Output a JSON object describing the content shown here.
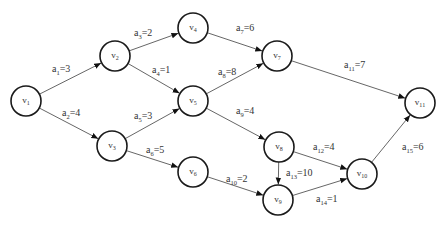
{
  "diagram": {
    "type": "directed-weighted-graph",
    "node_radius": 15,
    "colors": {
      "node_stroke": "#1a1a1a",
      "edge": "#555555",
      "text": "#333333",
      "background": "#ffffff"
    },
    "nodes": [
      {
        "id": "v1",
        "base": "v",
        "sub": "1",
        "x": 26,
        "y": 101
      },
      {
        "id": "v2",
        "base": "v",
        "sub": "2",
        "x": 115,
        "y": 56
      },
      {
        "id": "v3",
        "base": "v",
        "sub": "3",
        "x": 112,
        "y": 146
      },
      {
        "id": "v4",
        "base": "v",
        "sub": "4",
        "x": 193,
        "y": 28
      },
      {
        "id": "v5",
        "base": "v",
        "sub": "5",
        "x": 193,
        "y": 101
      },
      {
        "id": "v6",
        "base": "v",
        "sub": "6",
        "x": 193,
        "y": 172
      },
      {
        "id": "v7",
        "base": "v",
        "sub": "7",
        "x": 277,
        "y": 56
      },
      {
        "id": "v8",
        "base": "v",
        "sub": "8",
        "x": 279,
        "y": 147
      },
      {
        "id": "v9",
        "base": "v",
        "sub": "9",
        "x": 278,
        "y": 200
      },
      {
        "id": "v10",
        "base": "v",
        "sub": "10",
        "x": 362,
        "y": 174
      },
      {
        "id": "v11",
        "base": "v",
        "sub": "11",
        "x": 420,
        "y": 103
      }
    ],
    "edges": [
      {
        "id": "a1",
        "from": "v1",
        "to": "v2",
        "base": "a",
        "sub": "1",
        "weight": "3",
        "lx": 52,
        "ly": 72
      },
      {
        "id": "a2",
        "from": "v1",
        "to": "v3",
        "base": "a",
        "sub": "2",
        "weight": "4",
        "lx": 62,
        "ly": 116
      },
      {
        "id": "a3",
        "from": "v2",
        "to": "v4",
        "base": "a",
        "sub": "3",
        "weight": "2",
        "lx": 134,
        "ly": 36
      },
      {
        "id": "a4",
        "from": "v2",
        "to": "v5",
        "base": "a",
        "sub": "4",
        "weight": "1",
        "lx": 152,
        "ly": 73
      },
      {
        "id": "a5",
        "from": "v3",
        "to": "v5",
        "base": "a",
        "sub": "5",
        "weight": "3",
        "lx": 134,
        "ly": 119
      },
      {
        "id": "a6",
        "from": "v3",
        "to": "v6",
        "base": "a",
        "sub": "6",
        "weight": "5",
        "lx": 146,
        "ly": 153
      },
      {
        "id": "a7",
        "from": "v4",
        "to": "v7",
        "base": "a",
        "sub": "7",
        "weight": "6",
        "lx": 236,
        "ly": 31
      },
      {
        "id": "a8",
        "from": "v5",
        "to": "v7",
        "base": "a",
        "sub": "8",
        "weight": "8",
        "lx": 218,
        "ly": 75
      },
      {
        "id": "a9",
        "from": "v5",
        "to": "v8",
        "base": "a",
        "sub": "9",
        "weight": "4",
        "lx": 236,
        "ly": 114
      },
      {
        "id": "a10",
        "from": "v6",
        "to": "v9",
        "base": "a",
        "sub": "10",
        "weight": "2",
        "lx": 226,
        "ly": 182
      },
      {
        "id": "a11",
        "from": "v7",
        "to": "v11",
        "base": "a",
        "sub": "11",
        "weight": "7",
        "lx": 344,
        "ly": 68
      },
      {
        "id": "a12",
        "from": "v8",
        "to": "v10",
        "base": "a",
        "sub": "12",
        "weight": "4",
        "lx": 313,
        "ly": 150
      },
      {
        "id": "a13",
        "from": "v8",
        "to": "v9",
        "base": "a",
        "sub": "13",
        "weight": "10",
        "lx": 286,
        "ly": 176
      },
      {
        "id": "a14",
        "from": "v9",
        "to": "v10",
        "base": "a",
        "sub": "14",
        "weight": "1",
        "lx": 316,
        "ly": 202
      },
      {
        "id": "a15",
        "from": "v10",
        "to": "v11",
        "base": "a",
        "sub": "15",
        "weight": "6",
        "lx": 402,
        "ly": 150
      }
    ]
  }
}
